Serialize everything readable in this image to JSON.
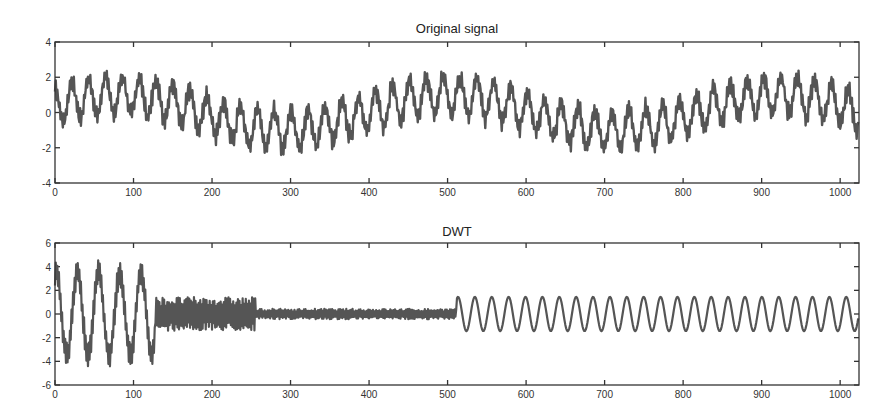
{
  "chart_data": [
    {
      "type": "line",
      "title": "Original signal",
      "xlabel": "",
      "ylabel": "",
      "xlim": [
        0,
        1024
      ],
      "ylim": [
        -4,
        4
      ],
      "x_ticks": [
        0,
        100,
        200,
        300,
        400,
        500,
        600,
        700,
        800,
        900,
        1000
      ],
      "y_ticks": [
        -4,
        -2,
        0,
        2,
        4
      ],
      "grid": false,
      "legend": null,
      "series": [
        {
          "name": "Original signal",
          "color": "#555555",
          "description": "Sum of a slow sinusoid (period ~420 samples, amplitude ~1), a medium sinusoid (period ~21 samples, amplitude ~1) and fast high-frequency jitter (amplitude ~0.5); values range approx -2.8 to 3",
          "components": [
            {
              "amplitude": 1.0,
              "period": 420,
              "phase": 0.35
            },
            {
              "amplitude": 1.05,
              "period": 21.5,
              "phase": 1.6
            },
            {
              "amplitude": 0.45,
              "period": 2.6,
              "phase": 0.0
            }
          ],
          "n": 1024
        }
      ]
    },
    {
      "type": "line",
      "title": "DWT",
      "xlabel": "",
      "ylabel": "",
      "xlim": [
        0,
        1024
      ],
      "ylim": [
        -6,
        6
      ],
      "x_ticks": [
        0,
        100,
        200,
        300,
        400,
        500,
        600,
        700,
        800,
        900,
        1000
      ],
      "y_ticks": [
        -6,
        -4,
        -2,
        0,
        2,
        4,
        6
      ],
      "grid": false,
      "legend": null,
      "series": [
        {
          "name": "DWT coefficients",
          "color": "#555555",
          "segments": [
            {
              "range": [
                0,
                128
              ],
              "label": "approximation + coarse detail",
              "amplitude": 3.5,
              "period": 27,
              "jitter": 1.0,
              "offset": 0
            },
            {
              "range": [
                128,
                256
              ],
              "label": "level-3 detail",
              "amplitude": 0,
              "period": 0,
              "jitter": 1.3,
              "offset": 0
            },
            {
              "range": [
                256,
                512
              ],
              "label": "level-2 detail",
              "amplitude": 0,
              "period": 0,
              "jitter": 0.4,
              "offset": 0
            },
            {
              "range": [
                512,
                1024
              ],
              "label": "level-1 detail",
              "amplitude": 1.45,
              "period": 21.5,
              "jitter": 0.0,
              "offset": 0
            }
          ]
        }
      ]
    }
  ]
}
